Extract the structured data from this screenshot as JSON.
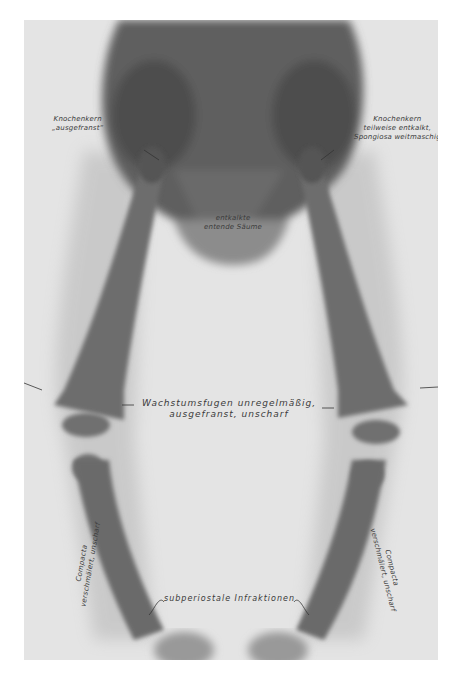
{
  "figure": {
    "type": "x-ray",
    "annotations": {
      "left_hip": [
        "Knochenkern",
        "„ausgefranst“"
      ],
      "right_hip": [
        "Knochenkern",
        "teilweise entkalkt,",
        "Spongiosa weitmaschig"
      ],
      "pelvis_center": [
        "entkalkte",
        "entende Säume"
      ],
      "growth_plates": [
        "Wachstumsfugen unregelmäßig,",
        "ausgefranst, unscharf"
      ],
      "left_tibia": [
        "Compacta",
        "verschmälert, unscharf"
      ],
      "right_tibia": [
        "Compacta",
        "verschmälert, unscharf"
      ],
      "infractions": "subperiostale Infraktionen"
    }
  }
}
